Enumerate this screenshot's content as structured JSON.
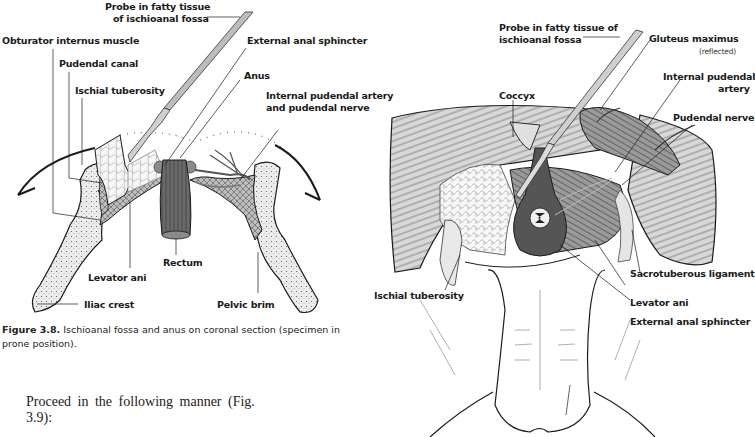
{
  "figure_3_8": {
    "labels": {
      "probe": [
        "Probe in fatty tissue",
        "of ischioanal fossa"
      ],
      "obturator": "Obturator internus muscle",
      "pudendal_canal": "Pudendal canal",
      "ischial_tuberosity": "Ischial tuberosity",
      "external_anal_sphincter": "External anal sphincter",
      "anus": "Anus",
      "internal_pudendal": [
        "Internal pudendal artery",
        "and pudendal nerve"
      ],
      "rectum": "Rectum",
      "levator_ani": "Levator ani",
      "iliac_crest": "Iliac crest",
      "pelvic_brim": "Pelvic brim"
    },
    "caption": {
      "number": "Figure 3.8.",
      "text": "Ischioanal fossa and anus on coronal section (specimen in prone position)."
    }
  },
  "body_text": {
    "line1": "Proceed in the following manner (Fig.",
    "line2": "3.9):"
  },
  "figure_3_9": {
    "labels": {
      "probe": [
        "Probe in fatty tissue of",
        "ischioanal fossa"
      ],
      "gluteus": "Gluteus maximus",
      "gluteus_note": "(reflected)",
      "internal_pudendal": [
        "Internal pudendal",
        "artery"
      ],
      "coccyx": "Coccyx",
      "pudendal_nerve": "Pudendal nerve",
      "sacrotuberous": "Sacrotuberous ligament",
      "ischial_tuberosity": "Ischial tuberosity",
      "levator_ani": "Levator ani",
      "external_anal_sphincter": "External anal sphincter"
    }
  },
  "colors": {
    "ink": "#1a1a1a",
    "muscle": "#6e6e6e",
    "bone": "#e4e4e4",
    "fat": "#f2f2f2"
  }
}
